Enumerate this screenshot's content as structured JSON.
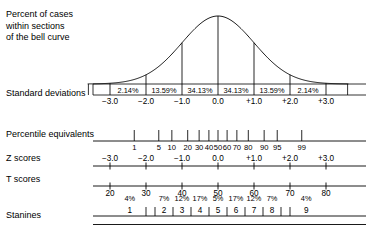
{
  "title": "Percent of cases\nwithin sections\nof the bell curve",
  "rows": {
    "standard_deviations": "Standard deviations",
    "percentile_equivalents": "Percentile equivalents",
    "z_scores": "Z scores",
    "t_scores": "T scores",
    "stanines": "Stanines"
  },
  "chart_data": {
    "type": "line",
    "title": "Percent of cases within sections of the bell curve",
    "xlabel": "Standard deviations",
    "ylabel": "",
    "grid": false,
    "legend": null,
    "xlim": [
      -3.6,
      3.6
    ],
    "distribution": "standard normal (bell curve)",
    "curve_peak_x": 0.0,
    "band_boundaries": [
      -3,
      -2,
      -1,
      0,
      1,
      2,
      3
    ],
    "bands": {
      "labels": [
        "2.14%",
        "13.59%",
        "34.13%",
        "34.13%",
        "13.59%",
        "2.14%"
      ],
      "values": [
        2.14,
        13.59,
        34.13,
        34.13,
        13.59,
        2.14
      ],
      "centers": [
        -2.5,
        -1.5,
        -0.5,
        0.5,
        1.5,
        2.5
      ]
    },
    "standard_deviations": {
      "ticks": [
        -3,
        -2,
        -1,
        0,
        1,
        2,
        3
      ],
      "labels": [
        "−3.0",
        "−2.0",
        "−1.0",
        "0.0",
        "+1.0",
        "+2.0",
        "+3.0"
      ]
    },
    "percentile_equivalents": {
      "labels": [
        "1",
        "5",
        "10",
        "20",
        "30",
        "40",
        "50",
        "60",
        "70",
        "80",
        "90",
        "95",
        "99"
      ],
      "z": [
        -2.326,
        -1.645,
        -1.282,
        -0.842,
        -0.524,
        -0.253,
        0.0,
        0.253,
        0.524,
        0.842,
        1.282,
        1.645,
        2.326
      ]
    },
    "z_scores": {
      "ticks": [
        -3,
        -2,
        -1,
        0,
        1,
        2,
        3
      ],
      "labels": [
        "−3.0",
        "−2.0",
        "−1.0",
        "0.0",
        "+1.0",
        "+2.0",
        "+3.0"
      ]
    },
    "t_scores": {
      "ticks": [
        -3,
        -2,
        -1,
        0,
        1,
        2,
        3
      ],
      "labels": [
        "20",
        "30",
        "40",
        "50",
        "60",
        "70",
        "80"
      ]
    },
    "stanines": {
      "labels": [
        "1",
        "2",
        "3",
        "4",
        "5",
        "6",
        "7",
        "8",
        "9"
      ],
      "percents": [
        "4%",
        "7%",
        "12%",
        "17%",
        "5%",
        "17%",
        "12%",
        "7%",
        "4%"
      ],
      "percent_values": [
        4,
        7,
        12,
        17,
        20,
        17,
        12,
        7,
        4
      ],
      "boundaries_z": [
        -1.75,
        -1.25,
        -0.75,
        -0.25,
        0.25,
        0.75,
        1.25,
        1.75
      ],
      "centers_z": [
        -2.45,
        -1.5,
        -1.0,
        -0.5,
        0.0,
        0.5,
        1.0,
        1.5,
        2.45
      ]
    }
  },
  "colors": {
    "ink": "#000000",
    "background": "#ffffff"
  }
}
